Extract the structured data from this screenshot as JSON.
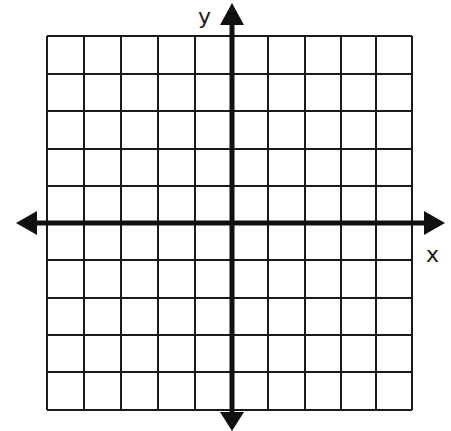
{
  "diagram": {
    "title": "",
    "type": "coordinate-plane",
    "x_axis_label": "x",
    "y_axis_label": "y",
    "grid": {
      "columns": 10,
      "rows": 10,
      "left": 47,
      "top": 36,
      "right": 412,
      "bottom": 410,
      "line_color": "#1a1a1a"
    },
    "axes": {
      "origin_px": [
        232,
        223
      ],
      "color": "#111111"
    }
  }
}
